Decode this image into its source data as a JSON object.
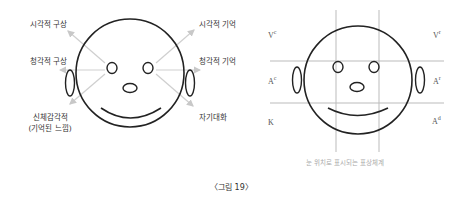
{
  "left_diagram": {
    "labels": {
      "visual_construct": "시각적 구상",
      "auditory_construct": "청각적 구상",
      "kinesthetic_line1": "신체감각적",
      "kinesthetic_line2": "(기억된 느낌)",
      "visual_remembered": "시각적 기억",
      "auditory_remembered": "청각적 기억",
      "internal_dialogue": "자기대화"
    }
  },
  "right_diagram": {
    "labels": {
      "vc": {
        "base": "V",
        "sup": "c"
      },
      "vr": {
        "base": "V",
        "sup": "r"
      },
      "ac": {
        "base": "A",
        "sup": "c"
      },
      "ar": {
        "base": "A",
        "sup": "r"
      },
      "k": {
        "base": "K",
        "sup": ""
      },
      "ad": {
        "base": "A",
        "sup": "d"
      }
    },
    "subtitle": "눈 위치로 표시되는 표상체계"
  },
  "caption": "〈그림 19〉",
  "colors": {
    "line": "#222222",
    "arrow": "#c8c8c8",
    "grid": "#b8b8b8",
    "subtitle": "#aaaaaa"
  }
}
